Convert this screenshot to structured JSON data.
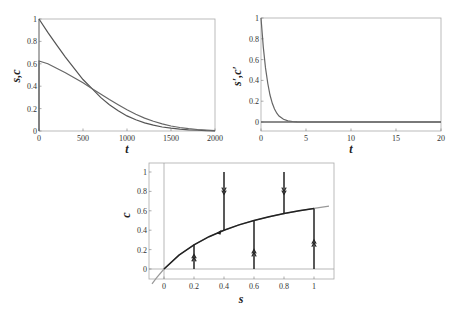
{
  "chart_data": [
    {
      "id": "sc-vs-t",
      "type": "line",
      "title": "",
      "xlabel": "t",
      "ylabel": "s, c",
      "xlim": [
        0,
        2000
      ],
      "ylim": [
        0,
        1
      ],
      "xticks": [
        0,
        500,
        1000,
        1500,
        2000
      ],
      "yticks": [
        0,
        0.2,
        0.4,
        0.6,
        0.8,
        1
      ],
      "ytick_labels": [
        "0",
        "0.2",
        "0.4",
        "0.6",
        "0.8",
        "1"
      ],
      "grid": false,
      "legend": null,
      "series": [
        {
          "name": "s",
          "x": [
            0,
            100,
            200,
            300,
            400,
            500,
            600,
            700,
            800,
            900,
            1000,
            1100,
            1200,
            1300,
            1400,
            1500,
            1600,
            1700,
            1800,
            1900,
            2000
          ],
          "values": [
            1.0,
            0.88,
            0.77,
            0.66,
            0.56,
            0.46,
            0.38,
            0.3,
            0.235,
            0.18,
            0.135,
            0.1,
            0.072,
            0.052,
            0.036,
            0.025,
            0.017,
            0.011,
            0.007,
            0.004,
            0.002
          ]
        },
        {
          "name": "c",
          "x": [
            0,
            0,
            100,
            200,
            300,
            400,
            500,
            600,
            700,
            800,
            900,
            1000,
            1100,
            1200,
            1300,
            1400,
            1500,
            1600,
            1700,
            1800,
            1900,
            2000
          ],
          "values": [
            0,
            0.625,
            0.6,
            0.56,
            0.52,
            0.475,
            0.43,
            0.38,
            0.33,
            0.28,
            0.235,
            0.19,
            0.15,
            0.115,
            0.087,
            0.063,
            0.045,
            0.031,
            0.021,
            0.013,
            0.008,
            0.004
          ]
        }
      ]
    },
    {
      "id": "sc-prime-vs-t",
      "type": "line",
      "title": "",
      "xlabel": "t",
      "ylabel": "s', c'",
      "xlim": [
        0,
        20
      ],
      "ylim": [
        -0.09,
        1
      ],
      "xticks": [
        0,
        5,
        10,
        15,
        20
      ],
      "yticks": [
        0,
        0.2,
        0.4,
        0.6,
        0.8,
        1
      ],
      "ytick_labels": [
        "0",
        "0.2",
        "0.4",
        "0.6",
        "0.8",
        "1"
      ],
      "grid": false,
      "legend": null,
      "series": [
        {
          "name": "s'",
          "x": [
            0,
            0.25,
            0.5,
            0.75,
            1,
            1.25,
            1.5,
            1.75,
            2,
            2.5,
            3,
            3.5,
            4,
            5,
            10,
            20
          ],
          "values": [
            1.0,
            0.72,
            0.52,
            0.37,
            0.26,
            0.18,
            0.125,
            0.085,
            0.058,
            0.027,
            0.012,
            0.005,
            0.002,
            0.0,
            0.0,
            0.0
          ]
        },
        {
          "name": "c'",
          "x": [
            0,
            20
          ],
          "values": [
            0,
            0
          ]
        }
      ]
    },
    {
      "id": "phase-plane",
      "type": "line",
      "title": "",
      "xlabel": "s",
      "ylabel": "c",
      "xlim": [
        -0.1,
        1.1
      ],
      "ylim": [
        -0.1,
        1.1
      ],
      "xticks": [
        0,
        0.2,
        0.4,
        0.6,
        0.8,
        1
      ],
      "xtick_labels": [
        "0",
        "0.2",
        "0.4",
        "0.6",
        "0.8",
        "1"
      ],
      "yticks": [
        0,
        0.2,
        0.4,
        0.6,
        0.8,
        1
      ],
      "ytick_labels": [
        "0",
        "0.2",
        "0.4",
        "0.6",
        "0.8",
        "1"
      ],
      "grid": false,
      "legend": null,
      "series": [
        {
          "name": "slow manifold c = s/(s+0.6) (extended)",
          "color": "#999999",
          "x": [
            -0.08,
            -0.05,
            0,
            0.1,
            0.2,
            0.3,
            0.4,
            0.5,
            0.6,
            0.7,
            0.8,
            0.9,
            1.0,
            1.1
          ],
          "values": [
            -0.154,
            -0.091,
            0,
            0.143,
            0.25,
            0.333,
            0.4,
            0.455,
            0.5,
            0.538,
            0.571,
            0.6,
            0.625,
            0.647
          ]
        },
        {
          "name": "trajectory along manifold",
          "color": "#222222",
          "x": [
            0,
            0.1,
            0.2,
            0.3,
            0.4,
            0.5,
            0.6,
            0.7,
            0.8,
            0.9,
            1.0
          ],
          "values": [
            0,
            0.143,
            0.25,
            0.333,
            0.4,
            0.455,
            0.5,
            0.538,
            0.571,
            0.6,
            0.625
          ]
        }
      ],
      "fast_trajectories": [
        {
          "s": 0.2,
          "c_from": 0,
          "c_to": 0.25,
          "direction": "up",
          "arrow_at": 0.12
        },
        {
          "s": 0.4,
          "c_from": 1,
          "c_to": 0.4,
          "direction": "down",
          "arrow_at": 0.8
        },
        {
          "s": 0.6,
          "c_from": 0,
          "c_to": 0.5,
          "direction": "up",
          "arrow_at": 0.17
        },
        {
          "s": 0.8,
          "c_from": 1,
          "c_to": 0.571,
          "direction": "down",
          "arrow_at": 0.8
        },
        {
          "s": 1.0,
          "c_from": 0,
          "c_to": 0.625,
          "direction": "up",
          "arrow_at": 0.27
        }
      ],
      "slow_arrow": {
        "s": 0.35,
        "c": 0.368,
        "direction": "left"
      }
    }
  ],
  "labels": {
    "p1_xlabel": "t",
    "p1_ylabel": "s,c",
    "p2_xlabel": "t",
    "p2_ylabel": "s′,c′",
    "p3_xlabel": "s",
    "p3_ylabel": "c",
    "p1_xticks": [
      "0",
      "500",
      "1000",
      "1500",
      "2000"
    ],
    "p1_yticks": [
      "0",
      "0.2",
      "0.4",
      "0.6",
      "0.8",
      "1"
    ],
    "p2_xticks": [
      "0",
      "5",
      "10",
      "15",
      "20"
    ],
    "p2_yticks": [
      "0",
      "0.2",
      "0.4",
      "0.6",
      "0.8",
      "1"
    ],
    "p3_xticks": [
      "0",
      "0.2",
      "0.4",
      "0.6",
      "0.8",
      "1"
    ],
    "p3_yticks": [
      "0",
      "0.2",
      "0.4",
      "0.6",
      "0.8",
      "1"
    ]
  },
  "colors": {
    "curve": "#555555",
    "frame": "#aaaaaa",
    "manifold_ext": "#999999",
    "trajectory": "#222222"
  }
}
